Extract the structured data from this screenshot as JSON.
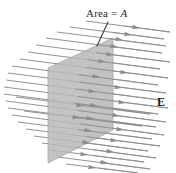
{
  "figure": {
    "background_color": "#ffffff",
    "width": 176,
    "height": 173
  },
  "labels": {
    "area": {
      "prefix": "Area = ",
      "symbol": "A",
      "full_text": "Area = A",
      "color": "#2b2b2b"
    },
    "field": {
      "symbol": "E",
      "full_text": "E",
      "is_vector": true,
      "color": "#1a1a1a"
    }
  },
  "plane": {
    "name": "area-plane",
    "shape": "parallelogram",
    "fill_color": "#b9b9b9",
    "stroke_color": "#9a9a9a",
    "opacity": 0.85,
    "points": "113,38 113,130 48,163 48,68"
  },
  "leader_line": {
    "name": "area-leader-line",
    "color": "#3a3a3a",
    "x1": 108,
    "y1": 22,
    "x2": 97,
    "y2": 46
  },
  "field_lines": {
    "color": "#8e8e8e",
    "arrow_color": "#8a8a8a",
    "count": 24,
    "direction": "left-to-right, slight downward slope",
    "lines": [
      {
        "x1": 57,
        "y1": 32,
        "x2": 166,
        "y2": 46,
        "arrow_x": 123,
        "arrow_y": 40
      },
      {
        "x1": 46,
        "y1": 38,
        "x2": 162,
        "y2": 53,
        "arrow_x": 118,
        "arrow_y": 47
      },
      {
        "x1": 36,
        "y1": 45,
        "x2": 170,
        "y2": 62,
        "arrow_x": 114,
        "arrow_y": 55
      },
      {
        "x1": 28,
        "y1": 52,
        "x2": 160,
        "y2": 69,
        "arrow_x": 106,
        "arrow_y": 62
      },
      {
        "x1": 20,
        "y1": 59,
        "x2": 168,
        "y2": 78,
        "arrow_x": 128,
        "arrow_y": 73
      },
      {
        "x1": 12,
        "y1": 66,
        "x2": 158,
        "y2": 85,
        "arrow_x": 100,
        "arrow_y": 77
      },
      {
        "x1": 8,
        "y1": 73,
        "x2": 166,
        "y2": 93,
        "arrow_x": 122,
        "arrow_y": 88
      },
      {
        "x1": 6,
        "y1": 80,
        "x2": 160,
        "y2": 100,
        "arrow_x": 96,
        "arrow_y": 92
      },
      {
        "x1": 4,
        "y1": 87,
        "x2": 168,
        "y2": 108,
        "arrow_x": 126,
        "arrow_y": 103
      },
      {
        "x1": 4,
        "y1": 94,
        "x2": 158,
        "y2": 114,
        "arrow_x": 98,
        "arrow_y": 106
      },
      {
        "x1": 6,
        "y1": 101,
        "x2": 166,
        "y2": 122,
        "arrow_x": 120,
        "arrow_y": 116
      },
      {
        "x1": 8,
        "y1": 108,
        "x2": 156,
        "y2": 127,
        "arrow_x": 94,
        "arrow_y": 119
      },
      {
        "x1": 12,
        "y1": 115,
        "x2": 164,
        "y2": 135,
        "arrow_x": 124,
        "arrow_y": 130
      },
      {
        "x1": 18,
        "y1": 122,
        "x2": 152,
        "y2": 139,
        "arrow_x": 92,
        "arrow_y": 131
      },
      {
        "x1": 26,
        "y1": 129,
        "x2": 160,
        "y2": 146,
        "arrow_x": 118,
        "arrow_y": 141
      },
      {
        "x1": 34,
        "y1": 136,
        "x2": 148,
        "y2": 151,
        "arrow_x": 90,
        "arrow_y": 143
      },
      {
        "x1": 42,
        "y1": 143,
        "x2": 156,
        "y2": 158,
        "arrow_x": 114,
        "arrow_y": 152
      },
      {
        "x1": 50,
        "y1": 150,
        "x2": 144,
        "y2": 162,
        "arrow_x": 88,
        "arrow_y": 155
      },
      {
        "x1": 58,
        "y1": 157,
        "x2": 150,
        "y2": 169,
        "arrow_x": 108,
        "arrow_y": 163
      },
      {
        "x1": 66,
        "y1": 164,
        "x2": 138,
        "y2": 173,
        "arrow_x": 96,
        "arrow_y": 168
      },
      {
        "x1": 70,
        "y1": 27,
        "x2": 164,
        "y2": 39,
        "arrow_x": 132,
        "arrow_y": 35
      },
      {
        "x1": 86,
        "y1": 21,
        "x2": 170,
        "y2": 32,
        "arrow_x": 140,
        "arrow_y": 28
      },
      {
        "x1": 16,
        "y1": 97,
        "x2": 150,
        "y2": 114,
        "arrow_x": 84,
        "arrow_y": 106
      },
      {
        "x1": 24,
        "y1": 111,
        "x2": 142,
        "y2": 126,
        "arrow_x": 80,
        "arrow_y": 118
      }
    ]
  }
}
